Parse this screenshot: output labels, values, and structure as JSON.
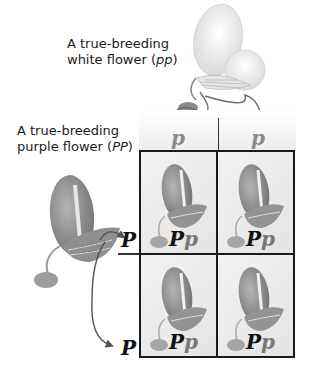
{
  "labels": {
    "white_parent_line1": "A true-breeding",
    "white_parent_line2": "white flower (",
    "white_parent_genotype": "pp",
    "white_parent_close": ")",
    "purple_parent_line1": "A true-breeding",
    "purple_parent_line2": "purple flower (",
    "purple_parent_genotype": "PP",
    "purple_parent_close": ")"
  },
  "gametes": {
    "white": [
      "p",
      "p"
    ],
    "purple": [
      "P",
      "P"
    ]
  },
  "punnett_square": {
    "cells": [
      {
        "dominant": "P",
        "recessive": "p"
      },
      {
        "dominant": "P",
        "recessive": "p"
      },
      {
        "dominant": "P",
        "recessive": "p"
      },
      {
        "dominant": "P",
        "recessive": "p"
      }
    ]
  },
  "colors": {
    "grid_line": "#1a1a1a",
    "purple_flower": "#8c8c8c",
    "white_flower": "#f2f2f2",
    "arrow": "#555555",
    "recessive_allele": "#777777",
    "dominant_allele": "#111111"
  }
}
